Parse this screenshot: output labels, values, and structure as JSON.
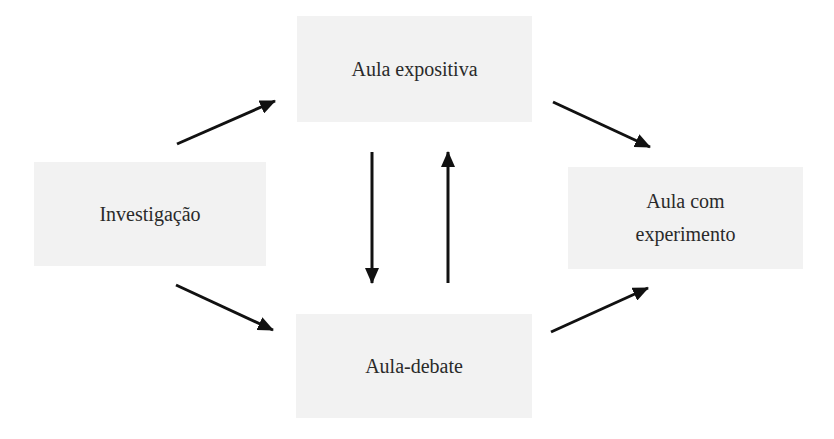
{
  "diagram": {
    "nodes": [
      {
        "id": "aula-expositiva",
        "lines": [
          "Aula expositiva"
        ],
        "x": 297,
        "y": 16,
        "w": 235,
        "h": 106
      },
      {
        "id": "investigacao",
        "lines": [
          "Investigação"
        ],
        "x": 34,
        "y": 162,
        "w": 232,
        "h": 104
      },
      {
        "id": "aula-com-experimento",
        "lines": [
          "Aula com",
          "experimento"
        ],
        "x": 568,
        "y": 167,
        "w": 235,
        "h": 102
      },
      {
        "id": "aula-debate",
        "lines": [
          "Aula-debate"
        ],
        "x": 296,
        "y": 314,
        "w": 236,
        "h": 104
      }
    ],
    "edges": [
      {
        "from": "investigacao",
        "to": "aula-expositiva",
        "x1": 177,
        "y1": 144,
        "x2": 275,
        "y2": 101
      },
      {
        "from": "aula-expositiva",
        "to": "aula-com-experimento",
        "x1": 553,
        "y1": 102,
        "x2": 650,
        "y2": 147
      },
      {
        "from": "investigacao",
        "to": "aula-debate",
        "x1": 176,
        "y1": 285,
        "x2": 273,
        "y2": 330
      },
      {
        "from": "aula-debate",
        "to": "aula-com-experimento",
        "x1": 551,
        "y1": 332,
        "x2": 648,
        "y2": 288
      },
      {
        "from": "aula-expositiva",
        "to": "aula-debate",
        "x1": 372,
        "y1": 152,
        "x2": 372,
        "y2": 283
      },
      {
        "from": "aula-debate",
        "to": "aula-expositiva",
        "x1": 448,
        "y1": 283,
        "x2": 448,
        "y2": 152
      }
    ],
    "colors": {
      "box_fill": "#f2f2f2",
      "arrow": "#111111",
      "text": "#2a2a2a"
    }
  }
}
